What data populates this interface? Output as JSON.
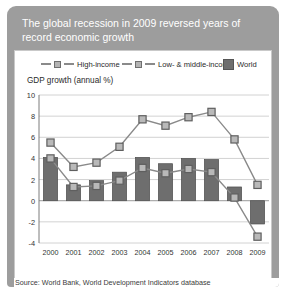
{
  "card": {
    "title": "The global recession in 2009 reversed years of record economic growth",
    "source": "Source: World Bank, World Development Indicators database"
  },
  "legend": [
    {
      "label": "High-income",
      "type": "line",
      "color": "#8a8a8a"
    },
    {
      "label": "Low- & middle-income",
      "type": "line",
      "color": "#8a8a8a"
    },
    {
      "label": "World",
      "type": "bar",
      "color": "#6e6e6e"
    }
  ],
  "chart_data": {
    "type": "bar",
    "title": "The global recession in 2009 reversed years of record economic growth",
    "subtitle": "GDP growth (annual %)",
    "xlabel": "",
    "ylabel": "GDP growth (annual %)",
    "categories": [
      "2000",
      "2001",
      "2002",
      "2003",
      "2004",
      "2005",
      "2006",
      "2007",
      "2008",
      "2009"
    ],
    "ylim": [
      -4,
      10
    ],
    "yticks": [
      10,
      8,
      6,
      4,
      2,
      0,
      -2,
      -4
    ],
    "grid": true,
    "legend_position": "top",
    "series": [
      {
        "name": "World",
        "type": "bar",
        "color": "#6e6e6e",
        "values": [
          4.1,
          1.5,
          1.9,
          2.7,
          4.1,
          3.5,
          4.0,
          3.9,
          1.3,
          -2.2
        ]
      },
      {
        "name": "Low- & middle-income",
        "type": "line",
        "color": "#8a8a8a",
        "values": [
          5.5,
          3.2,
          3.6,
          5.1,
          7.7,
          7.1,
          7.9,
          8.4,
          5.8,
          1.5
        ]
      },
      {
        "name": "High-income",
        "type": "line",
        "color": "#8a8a8a",
        "values": [
          4.0,
          1.3,
          1.4,
          1.9,
          3.1,
          2.6,
          3.0,
          2.7,
          0.3,
          -3.4
        ]
      }
    ]
  }
}
